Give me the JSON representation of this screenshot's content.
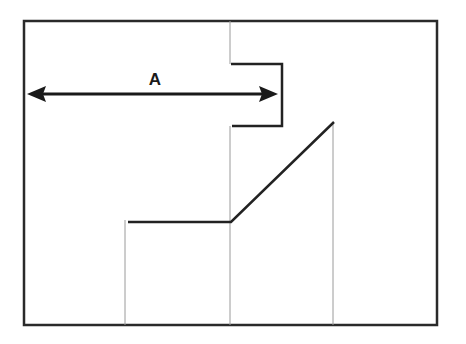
{
  "diagram": {
    "dimension_label": "A",
    "colors": {
      "frame": "#2a2a2a",
      "profile": "#222222",
      "guide": "#9a9a9a",
      "arrow": "#1a1a1a",
      "background": "#ffffff"
    },
    "frame": {
      "x": 24,
      "y": 21,
      "width": 413,
      "height": 304
    },
    "dimension_arrow": {
      "x1": 27,
      "x2": 278,
      "y": 94
    },
    "profile_points": [
      [
        128,
        222
      ],
      [
        231,
        222
      ],
      [
        334,
        122
      ]
    ],
    "step_points": [
      [
        231,
        64
      ],
      [
        282,
        64
      ],
      [
        282,
        126
      ],
      [
        232,
        126
      ]
    ],
    "guide_lines": [
      {
        "x": 230,
        "y1": 21,
        "y2": 64
      },
      {
        "x": 230,
        "y1": 126,
        "y2": 325
      },
      {
        "x": 125,
        "y1": 220,
        "y2": 325
      },
      {
        "x": 333,
        "y1": 122,
        "y2": 325
      }
    ]
  }
}
